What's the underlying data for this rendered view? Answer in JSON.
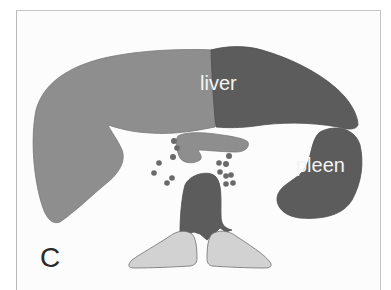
{
  "figure": {
    "panel_letter": "C",
    "labels": {
      "liver": "liver",
      "spleen": "pleen"
    },
    "colors": {
      "background": "#fcfcfc",
      "liver_left_lobe": "#8e8e8e",
      "liver_right_lobe": "#5c5c5c",
      "spleen": "#5c5c5c",
      "stomach_duodenum": "#8e8e8e",
      "lymph_nodes": "#6a6a6a",
      "aorta_vertebra": "#5c5c5c",
      "kidneys": "#d2d2d2",
      "outline": "#707070"
    }
  }
}
